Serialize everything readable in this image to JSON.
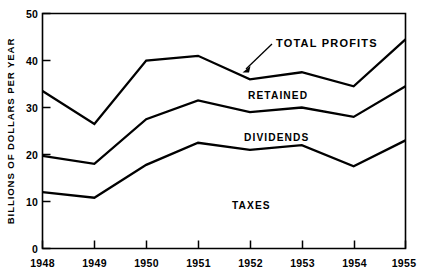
{
  "chart_data": {
    "type": "line",
    "title": "",
    "subtitle": "",
    "xlabel": "",
    "ylabel": "BILLIONS OF DOLLARS PER YEAR",
    "categories": [
      "1948",
      "1949",
      "1950",
      "1951",
      "1952",
      "1953",
      "1954",
      "1955"
    ],
    "x": [
      1948,
      1949,
      1950,
      1951,
      1952,
      1953,
      1954,
      1955
    ],
    "xlim": [
      1948,
      1955
    ],
    "ylim": [
      0,
      50
    ],
    "yticks": [
      0,
      10,
      20,
      30,
      40,
      50
    ],
    "ytick_labels": [
      "0",
      "10",
      "20",
      "30",
      "40",
      "50"
    ],
    "grid": false,
    "legend_position": "inline-annotations",
    "stacked": true,
    "series": [
      {
        "name": "TOTAL PROFITS",
        "description": "cumulative top boundary line",
        "values": [
          33.5,
          26.5,
          40.0,
          41.0,
          36.0,
          37.5,
          34.5,
          44.5
        ]
      },
      {
        "name": "RETAINED",
        "description": "boundary between retained band and dividends band",
        "values": [
          19.7,
          18.0,
          27.5,
          31.5,
          29.0,
          30.0,
          28.0,
          34.5
        ]
      },
      {
        "name": "DIVIDENDS",
        "description": "boundary between dividends band and taxes band",
        "values": [
          12.0,
          10.8,
          17.8,
          22.5,
          21.0,
          22.0,
          17.5,
          23.0
        ]
      },
      {
        "name": "TAXES",
        "description": "bottom band, measured from zero baseline",
        "values": [
          12.0,
          10.8,
          17.8,
          22.5,
          21.0,
          22.0,
          17.5,
          23.0
        ]
      }
    ],
    "annotations": [
      {
        "name": "total-profits",
        "text": "TOTAL PROFITS",
        "x": 1952.1,
        "y": 44.0
      },
      {
        "name": "retained",
        "text": "RETAINED",
        "x": 1952.0,
        "y": 33.8
      },
      {
        "name": "dividends",
        "text": "DIVIDENDS",
        "x": 1952.1,
        "y": 25.0
      },
      {
        "name": "taxes",
        "text": "TAXES",
        "x": 1952.2,
        "y": 9.8
      }
    ]
  },
  "labels": {
    "y_axis_title": "BILLIONS OF DOLLARS PER YEAR",
    "series_total_profits": "TOTAL PROFITS",
    "series_retained": "RETAINED",
    "series_dividends": "DIVIDENDS",
    "series_taxes": "TAXES",
    "ytick_0": "0",
    "ytick_10": "10",
    "ytick_20": "20",
    "ytick_30": "30",
    "ytick_40": "40",
    "ytick_50": "50",
    "xtick_1948": "1948",
    "xtick_1949": "1949",
    "xtick_1950": "1950",
    "xtick_1951": "1951",
    "xtick_1952": "1952",
    "xtick_1953": "1953",
    "xtick_1954": "1954",
    "xtick_1955": "1955"
  },
  "colors": {
    "background": "#ffffff",
    "line": "#000000",
    "axis": "#000000",
    "text": "#000000"
  }
}
